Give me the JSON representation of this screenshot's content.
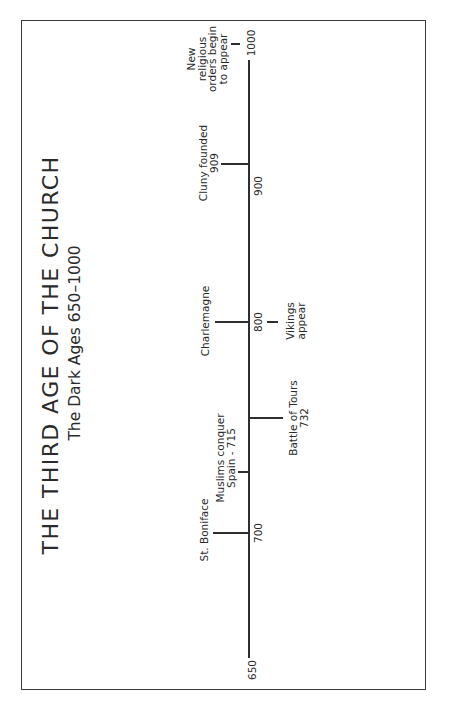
{
  "title": "THE THIRD AGE OF THE CHURCH",
  "subtitle": "The Dark Ages 650–1000",
  "axis": {
    "start_label": "650",
    "ticks": [
      "700",
      "800",
      "900",
      "1000"
    ]
  },
  "events": {
    "boniface": {
      "line1": "St. Boniface"
    },
    "muslims": {
      "line1": "Muslims conquer",
      "line2": "Spain - 715"
    },
    "tours": {
      "line1": "Battle of Tours",
      "line2": "732"
    },
    "charlemagne": {
      "line1": "Charlemagne"
    },
    "vikings": {
      "line1": "Vikings",
      "line2": "appear"
    },
    "cluny": {
      "line1": "Cluny founded",
      "line2": "909"
    },
    "orders": {
      "line1": "New",
      "line2": "religious",
      "line3": "orders begin",
      "line4": "to appear"
    }
  },
  "colors": {
    "ink": "#2f2f2f",
    "background": "#ffffff"
  }
}
